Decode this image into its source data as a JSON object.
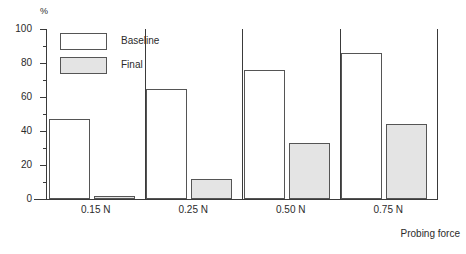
{
  "chart_data": {
    "type": "bar",
    "title": "",
    "xlabel": "Probing force",
    "ylabel": "%",
    "categories": [
      "0.15 N",
      "0.25 N",
      "0.50 N",
      "0.75 N"
    ],
    "series": [
      {
        "name": "Baseline",
        "values": [
          47,
          65,
          76,
          86
        ],
        "fill": "#ffffff",
        "stroke": "#555555"
      },
      {
        "name": "Final",
        "values": [
          2,
          12,
          33,
          44
        ],
        "fill": "#e4e4e4",
        "stroke": "#555555"
      }
    ],
    "ylim": [
      0,
      100
    ],
    "y_major_ticks": [
      0,
      20,
      40,
      60,
      80,
      100
    ],
    "y_minor_ticks": [
      10,
      30,
      50,
      70,
      90
    ],
    "y_tick_labels": [
      "0",
      "20",
      "40",
      "60",
      "80",
      "100"
    ],
    "grid": false,
    "legend_position": "top-left-inside"
  },
  "axes": {
    "y_unit_label": "%",
    "x_axis_title": "Probing force"
  },
  "legend": {
    "entries": [
      {
        "label": "Baseline"
      },
      {
        "label": "Final"
      }
    ]
  }
}
